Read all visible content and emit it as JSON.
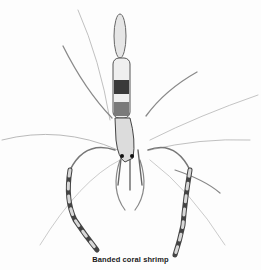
{
  "figure": {
    "caption": "Banded coral shrimp"
  },
  "colors": {
    "background": "#fdfdfd",
    "ink": "#2a2a2a",
    "light_ink": "#9a9a9a"
  }
}
